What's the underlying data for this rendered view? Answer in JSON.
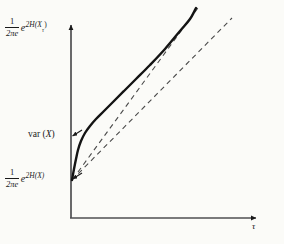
{
  "figure": {
    "background_color": "#fbfbf8",
    "ink_color": "#1a1a1a",
    "width": 284,
    "height": 244
  },
  "axes": {
    "x_axis": {
      "label": "τ",
      "label_name": "tau",
      "origin_x": 71,
      "end_x": 262,
      "y": 218,
      "arrow": true
    },
    "y_axis": {
      "x": 71,
      "bottom_y": 218,
      "top_y": 22,
      "arrow": true
    }
  },
  "y_labels": {
    "top": {
      "text": "1/(2πe) e^{2H(X_τ)}",
      "fraction_numerator": "1",
      "fraction_denominator": "2πe",
      "exponent_base": "e",
      "exponent": "2H(X",
      "exponent_subscript": "τ",
      "exponent_close": ")",
      "tick_y": 22
    },
    "middle": {
      "text": "var (X)",
      "prefix": "var",
      "open_paren": " (",
      "variable": "X",
      "close_paren": ")",
      "tick_y": 136
    },
    "bottom": {
      "text": "1/(2πe) e^{2H(X)}",
      "fraction_numerator": "1",
      "fraction_denominator": "2πe",
      "exponent_base": "e",
      "exponent": "2H(X)",
      "tick_y": 179
    }
  },
  "chart_data": {
    "type": "line",
    "title": "",
    "xlabel": "τ",
    "ylabel": "",
    "grid": false,
    "legend": "none",
    "series": [
      {
        "name": "solid-curve",
        "style": "solid",
        "stroke_width": 2.4,
        "color": "#141414",
        "points": [
          [
            72,
            180
          ],
          [
            74,
            169
          ],
          [
            76,
            159
          ],
          [
            78,
            150
          ],
          [
            81,
            141
          ],
          [
            85,
            133
          ],
          [
            90,
            126
          ],
          [
            96,
            119
          ],
          [
            104,
            111
          ],
          [
            113,
            102
          ],
          [
            124,
            91
          ],
          [
            136,
            79
          ],
          [
            150,
            65
          ],
          [
            165,
            49
          ],
          [
            180,
            31
          ],
          [
            190,
            19
          ],
          [
            196,
            8
          ]
        ]
      },
      {
        "name": "upper-asymptote",
        "style": "dashed",
        "stroke_width": 1.1,
        "color": "#4a4a4a",
        "points": [
          [
            78,
            172
          ],
          [
            200,
            5
          ]
        ]
      },
      {
        "name": "lower-asymptote",
        "style": "dashed",
        "stroke_width": 1.1,
        "color": "#4a4a4a",
        "points": [
          [
            72,
            180
          ],
          [
            232,
            18
          ]
        ]
      }
    ],
    "tick_markers": [
      {
        "name": "var-tick",
        "x": 71,
        "y": 136
      },
      {
        "name": "lower-tick",
        "x": 71,
        "y": 179
      }
    ]
  }
}
